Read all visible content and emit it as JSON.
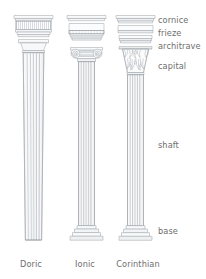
{
  "figure": {
    "background_color": "#ffffff",
    "line_color": "#9aa0a6",
    "fill_light": "#fbfbfc",
    "fill_shade": "#eceef0",
    "text_color": "#6e6e6e"
  },
  "part_labels": {
    "cornice": "cornice",
    "frieze": "frieze",
    "architrave": "architrave",
    "capital": "capital",
    "shaft": "shaft",
    "base": "base"
  },
  "order_labels": {
    "doric": "Doric",
    "ionic": "Ionic",
    "corinthian": "Corinthian"
  }
}
